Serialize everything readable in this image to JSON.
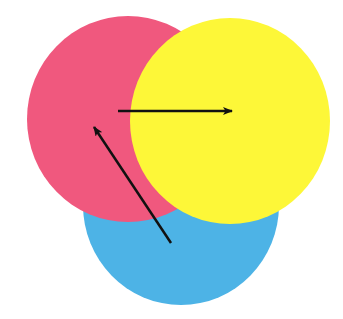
{
  "diagram": {
    "type": "overlapping-circles-with-arrows",
    "background": "#ffffff",
    "circles": [
      {
        "name": "blue",
        "color": "#4db3e6",
        "cx": 181,
        "cy": 205,
        "rx": 98,
        "ry": 100
      },
      {
        "name": "red",
        "color": "#f0587e",
        "cx": 128,
        "cy": 119,
        "rx": 101,
        "ry": 103
      },
      {
        "name": "yellow",
        "color": "#fdf738",
        "cx": 230,
        "cy": 121,
        "rx": 100,
        "ry": 103
      }
    ],
    "arrows": [
      {
        "name": "red-to-yellow",
        "x1": 118,
        "y1": 111,
        "x2": 232,
        "y2": 111,
        "color": "#111111"
      },
      {
        "name": "blue-to-red",
        "x1": 171,
        "y1": 243,
        "x2": 94,
        "y2": 127,
        "color": "#111111"
      }
    ]
  }
}
